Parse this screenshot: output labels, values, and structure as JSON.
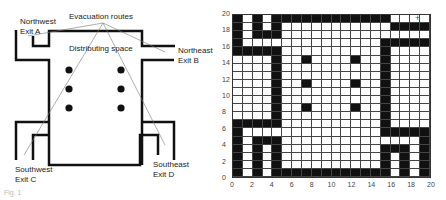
{
  "left_diagram": {
    "labels": {
      "northwest": "Northwest",
      "exit_a": "Exit A",
      "evacuation_routes": "Evacuation routes",
      "distributing_space": "Distributing space",
      "northeast": "Northeast",
      "exit_b": "Exit B",
      "southwest": "Southwest",
      "exit_c": "Exit C",
      "southeast": "Southeast",
      "exit_d": "Exit D"
    },
    "obstacle_count": 6
  },
  "figure_caption": "Fig. 1",
  "chart_data": {
    "type": "heatmap",
    "title": "",
    "xlabel": "",
    "ylabel": "",
    "xlim": [
      0,
      20
    ],
    "ylim": [
      0,
      20
    ],
    "x_ticks": [
      "0",
      "2",
      "4",
      "6",
      "8",
      "10",
      "12",
      "14",
      "16",
      "18",
      "20"
    ],
    "y_ticks": [
      "0",
      "2",
      "4",
      "6",
      "8",
      "10",
      "12",
      "14",
      "16",
      "18",
      "20"
    ],
    "grid": true,
    "cell_values": "1 = wall/obstacle (black), 0 = free (white); rows listed top (y=19) to bottom (y=0)",
    "rows": [
      "10101111111111110000",
      "10101000000000001111",
      "10111000000000000000",
      "10000000000000011111",
      "11111000000000010000",
      "00001001000010010000",
      "00001000000000010000",
      "00001000000000010000",
      "00001001000010010000",
      "00001000000000010000",
      "00001000000000010000",
      "00001001000010010000",
      "00001000000000010000",
      "11111000000000010000",
      "10000000000000011111",
      "10111000000000000001",
      "10101000000000011101",
      "10101000000000010101",
      "10101000000000010101",
      "10101111111111110101"
    ],
    "obstacles": [
      [
        7,
        14
      ],
      [
        7,
        11
      ],
      [
        7,
        8
      ],
      [
        12,
        14
      ],
      [
        12,
        11
      ],
      [
        12,
        8
      ]
    ]
  }
}
